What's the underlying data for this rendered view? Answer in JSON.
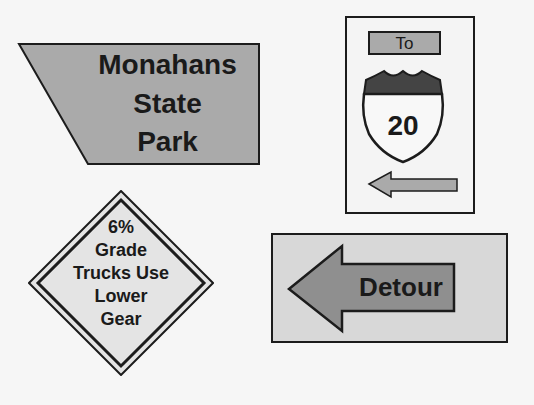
{
  "signs": {
    "park": {
      "lines": [
        "Monahans",
        "State",
        "Park"
      ],
      "fill": "#aaaaaa"
    },
    "interstate": {
      "to_label": "To",
      "route_number": "20",
      "arrow_direction": "left",
      "fill": "#aaaaaa"
    },
    "warning": {
      "lines": [
        "6%",
        "Grade",
        "Trucks Use",
        "Lower",
        "Gear"
      ],
      "fill": "#e4e4e4"
    },
    "detour": {
      "label": "Detour",
      "arrow_direction": "left",
      "fill": "#8f8f8f",
      "background": "#d8d8d8"
    }
  }
}
